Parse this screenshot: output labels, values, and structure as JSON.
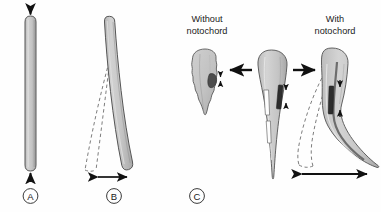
{
  "figure": {
    "background_color": "#fefefe",
    "stroke_color": "#4a4a4a",
    "body_fill": "#c9c9c9",
    "body_fill_dark": "#a8a8a8",
    "muscle_fill": "#3a3a3a",
    "arrow_color": "#111111",
    "dashed_color": "#6e6e6e",
    "text_color": "#1a1a1a"
  },
  "panels": [
    {
      "id": "A",
      "label": "A",
      "description": "Straight unbent rod under axial compression",
      "arrows": [
        "compression-arrow-top",
        "compression-arrow-bottom"
      ]
    },
    {
      "id": "B",
      "label": "B",
      "description": "Rod bending laterally with dashed range-of-motion outlines",
      "arrows": [
        "lateral-displacement-arrow"
      ]
    },
    {
      "id": "C",
      "label": "C",
      "description": "Comparison of larval tail mechanics with and without notochord",
      "arrows": [
        "arrow-to-without",
        "arrow-to-with"
      ]
    }
  ],
  "panel_c": {
    "left_label_line1": "Without",
    "left_label_line2": "notochord",
    "right_label_line1": "With",
    "right_label_line2": "notochord",
    "left_figure": "irregular-collapsed-larva",
    "center_figure": "straight-larva-with-notochord",
    "right_figure": "flexed-larva-with-notochord"
  },
  "labels": {
    "a": "A",
    "b": "B",
    "c": "C"
  }
}
